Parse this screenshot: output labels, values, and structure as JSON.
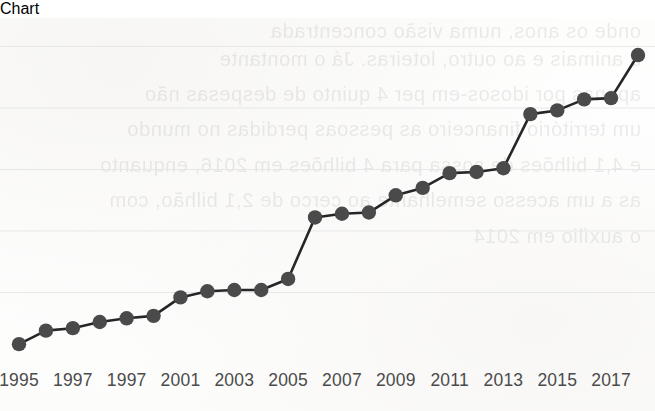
{
  "chart_data": {
    "type": "line",
    "title": "",
    "subtitle": "",
    "xlabel": "",
    "ylabel": "",
    "grid": true,
    "gridlines_y": [
      1,
      2,
      3,
      4,
      5
    ],
    "legend": null,
    "legend_position": "none",
    "xlim": [
      1995,
      2018
    ],
    "ylim": [
      0,
      5.3
    ],
    "marker": "circle",
    "marker_color": "#4a4a4a",
    "line_color": "#262626",
    "x": [
      1995,
      1996,
      1997,
      1998,
      1999,
      2000,
      2001,
      2002,
      2003,
      2004,
      2005,
      2006,
      2007,
      2008,
      2009,
      2010,
      2011,
      2012,
      2013,
      2014,
      2015,
      2016,
      2017,
      2018
    ],
    "values": [
      0.16,
      0.38,
      0.42,
      0.52,
      0.58,
      0.62,
      0.92,
      1.02,
      1.04,
      1.04,
      1.22,
      2.22,
      2.28,
      2.3,
      2.58,
      2.7,
      2.94,
      2.96,
      3.02,
      3.9,
      3.96,
      4.14,
      4.16,
      4.86
    ],
    "tick_labels": [
      {
        "label": "1995",
        "x": 1995
      },
      {
        "label": "1997",
        "x": 1997
      },
      {
        "label": "1997",
        "x": 1999
      },
      {
        "label": "2001",
        "x": 2001
      },
      {
        "label": "2003",
        "x": 2003
      },
      {
        "label": "2005",
        "x": 2005
      },
      {
        "label": "2007",
        "x": 2007
      },
      {
        "label": "2009",
        "x": 2009
      },
      {
        "label": "2011",
        "x": 2011
      },
      {
        "label": "2013",
        "x": 2013
      },
      {
        "label": "2015",
        "x": 2015
      },
      {
        "label": "2017",
        "x": 2017
      }
    ]
  },
  "page": {
    "background_color": "#ffffff",
    "showthrough_lines": [
      "onde os anos, numa visão concentrada",
      "a animais e ao outro, loteiras. Já o montante",
      "apenas por idosos-em per 4 quinto de despesas não",
      "um território financeiro as pessoas perdidas no mundo",
      "e 4,1 bilhões de sossa para 4 bilhões em 2016, enquanto",
      "as a um acesso semelhante ao cerco de 2,1 bilhão, com",
      "o auxílio em 2014"
    ]
  }
}
